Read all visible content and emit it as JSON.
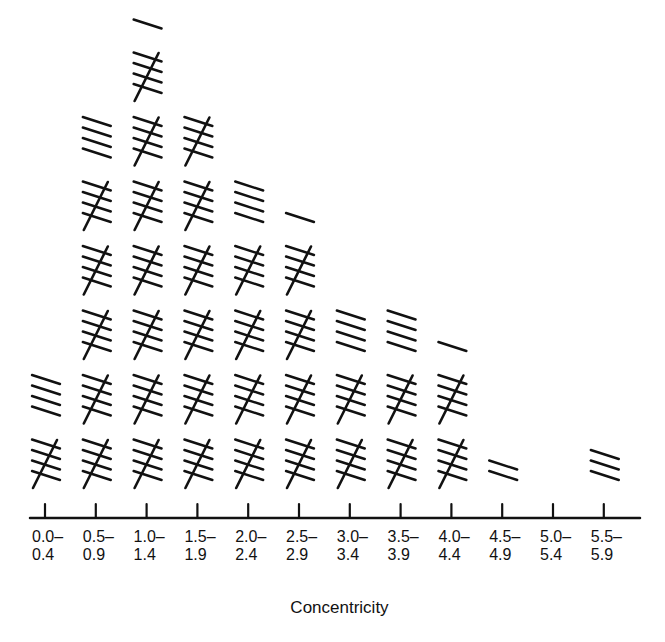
{
  "chart_data": {
    "type": "bar",
    "style": "tally-marks",
    "title": "",
    "xlabel": "Concentricity",
    "ylabel": "",
    "categories": [
      "0.0–0.4",
      "0.5–0.9",
      "1.0–1.4",
      "1.5–1.9",
      "2.0–2.4",
      "2.5–2.9",
      "3.0–3.4",
      "3.5–3.9",
      "4.0–4.4",
      "4.5–4.9",
      "5.0–5.4",
      "5.5–5.9"
    ],
    "tick_labels": [
      {
        "top": "0.0–",
        "bottom": "0.4"
      },
      {
        "top": "0.5–",
        "bottom": "0.9"
      },
      {
        "top": "1.0–",
        "bottom": "1.4"
      },
      {
        "top": "1.5–",
        "bottom": "1.9"
      },
      {
        "top": "2.0–",
        "bottom": "2.4"
      },
      {
        "top": "2.5–",
        "bottom": "2.9"
      },
      {
        "top": "3.0–",
        "bottom": "3.4"
      },
      {
        "top": "3.5–",
        "bottom": "3.9"
      },
      {
        "top": "4.0–",
        "bottom": "4.4"
      },
      {
        "top": "4.5–",
        "bottom": "4.9"
      },
      {
        "top": "5.0–",
        "bottom": "5.4"
      },
      {
        "top": "5.5–",
        "bottom": "5.9"
      }
    ],
    "values": [
      9,
      29,
      36,
      30,
      24,
      21,
      14,
      14,
      11,
      2,
      0,
      3
    ],
    "tally_group_size": 5,
    "grid": false,
    "legend": null,
    "ink_color": "#111111"
  }
}
